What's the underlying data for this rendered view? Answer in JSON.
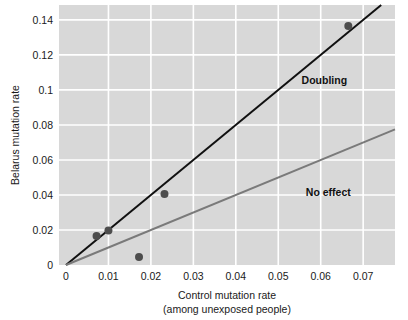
{
  "chart_data": {
    "type": "scatter",
    "title": "",
    "xlabel": "Control mutation rate",
    "xlabel_line2": "(among unexposed people)",
    "ylabel": "Belarus mutation rate",
    "xlim": [
      0,
      0.0775
    ],
    "ylim": [
      0,
      0.1485
    ],
    "grid": true,
    "grid_color": "#ffffff",
    "plot_background": "#d8d8d8",
    "legend_position": "inline-annotations",
    "xticks": [
      0,
      0.01,
      0.02,
      0.03,
      0.04,
      0.05,
      0.06,
      0.07
    ],
    "xtick_labels": [
      "0",
      "0.01",
      "0.02",
      "0.03",
      "0.04",
      "0.05",
      "0.06",
      "0.07"
    ],
    "yticks": [
      0,
      0.02,
      0.04,
      0.06,
      0.08,
      0.1,
      0.12,
      0.14
    ],
    "ytick_labels": [
      "0",
      "0.02",
      "0.04",
      "0.06",
      "0.08",
      "0.1",
      "0.12",
      "0.14"
    ],
    "points": [
      {
        "x": 0.0072,
        "y": 0.0165
      },
      {
        "x": 0.01,
        "y": 0.0197
      },
      {
        "x": 0.0172,
        "y": 0.0045
      },
      {
        "x": 0.0232,
        "y": 0.0405
      },
      {
        "x": 0.0665,
        "y": 0.1365
      }
    ],
    "point_color": "#4d4d4d",
    "point_radius": 4,
    "reference_lines": [
      {
        "name": "Doubling",
        "label": "Doubling",
        "slope": 2,
        "intercept": 0,
        "color": "#111111",
        "width": 2,
        "label_x": 0.0555,
        "label_y": 0.1035
      },
      {
        "name": "No effect",
        "label": "No effect",
        "slope": 1,
        "intercept": 0,
        "color": "#7a7a7a",
        "width": 2,
        "label_x": 0.0565,
        "label_y": 0.0395
      }
    ]
  }
}
